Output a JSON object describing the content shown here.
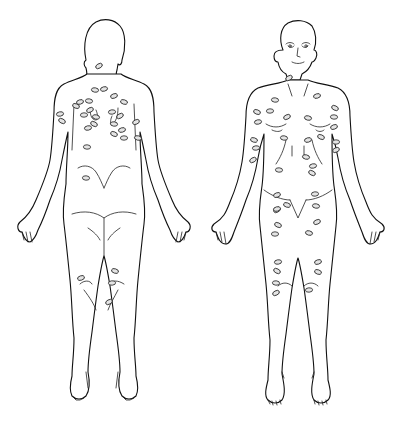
{
  "figure": {
    "type": "body-map",
    "views": [
      {
        "id": "posterior",
        "label": "",
        "lesion_count": 29
      },
      {
        "id": "anterior",
        "label": "",
        "lesion_count": 40
      }
    ],
    "colors": {
      "line": "#111111",
      "lesion_fill": "#e4e4e4",
      "background": "#ffffff"
    }
  },
  "lesions": {
    "posterior": [
      [
        99,
        66
      ],
      [
        89,
        101
      ],
      [
        80,
        102
      ],
      [
        76,
        106
      ],
      [
        84,
        115
      ],
      [
        90,
        110
      ],
      [
        96,
        117
      ],
      [
        88,
        128
      ],
      [
        94,
        124
      ],
      [
        87,
        147
      ],
      [
        114,
        96
      ],
      [
        124,
        102
      ],
      [
        112,
        112
      ],
      [
        120,
        116
      ],
      [
        114,
        124
      ],
      [
        122,
        130
      ],
      [
        114,
        134
      ],
      [
        124,
        138
      ],
      [
        136,
        122
      ],
      [
        138,
        138
      ],
      [
        60,
        114
      ],
      [
        62,
        121
      ],
      [
        86,
        178
      ],
      [
        81,
        278
      ],
      [
        115,
        271
      ],
      [
        112,
        283
      ],
      [
        109,
        302
      ],
      [
        95,
        90
      ],
      [
        104,
        89
      ]
    ],
    "anterior": [
      [
        289,
        78
      ],
      [
        275,
        100
      ],
      [
        317,
        96
      ],
      [
        257,
        112
      ],
      [
        270,
        111
      ],
      [
        287,
        117
      ],
      [
        308,
        118
      ],
      [
        258,
        122
      ],
      [
        335,
        108
      ],
      [
        334,
        117
      ],
      [
        334,
        127
      ],
      [
        254,
        140
      ],
      [
        256,
        148
      ],
      [
        253,
        160
      ],
      [
        284,
        138
      ],
      [
        308,
        140
      ],
      [
        321,
        137
      ],
      [
        336,
        142
      ],
      [
        336,
        150
      ],
      [
        306,
        157
      ],
      [
        313,
        166
      ],
      [
        312,
        173
      ],
      [
        279,
        170
      ],
      [
        277,
        195
      ],
      [
        287,
        205
      ],
      [
        315,
        194
      ],
      [
        277,
        210
      ],
      [
        316,
        206
      ],
      [
        277,
        209
      ],
      [
        278,
        225
      ],
      [
        275,
        234
      ],
      [
        317,
        222
      ],
      [
        309,
        233
      ],
      [
        278,
        262
      ],
      [
        277,
        271
      ],
      [
        276,
        283
      ],
      [
        318,
        262
      ],
      [
        318,
        272
      ],
      [
        309,
        290
      ],
      [
        276,
        293
      ]
    ]
  }
}
